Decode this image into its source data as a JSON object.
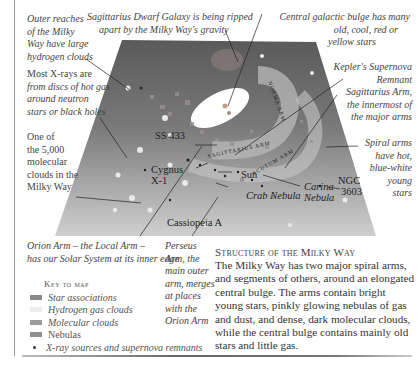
{
  "map": {
    "callouts_left": [
      {
        "id": "outer-reaches",
        "lines": [
          "Outer reaches",
          "of the Milky",
          "Way have large",
          "hydrogen clouds"
        ]
      },
      {
        "id": "x-rays",
        "lines": [
          "Most X-rays are",
          "from discs of hot gas",
          "around neutron",
          "stars or black holes"
        ]
      },
      {
        "id": "molecular-clouds",
        "lines": [
          "One of",
          "the 5,000",
          "molecular",
          "clouds in the",
          "Milky Way"
        ]
      }
    ],
    "callouts_top": [
      {
        "id": "sagittarius-dwarf",
        "lines": [
          "Sagittarius Dwarf Galaxy is being ripped",
          "apart by the Milky Way's gravity"
        ]
      },
      {
        "id": "central-bulge",
        "lines": [
          "Central galactic bulge has many",
          "old, cool, red or",
          "yellow stars"
        ]
      }
    ],
    "callouts_right": [
      {
        "id": "kepler",
        "lines": [
          "Kepler's Supernova",
          "Remnant"
        ]
      },
      {
        "id": "sagittarius-arm",
        "lines": [
          "Sagittarius Arm,",
          "the innermost of",
          "the major arms"
        ]
      },
      {
        "id": "spiral-arms",
        "lines": [
          "Spiral arms",
          "have hot,",
          "blue-white",
          "young",
          "stars"
        ]
      }
    ],
    "callouts_bottom": [
      {
        "id": "orion-arm",
        "lines": [
          "Orion Arm – the Local Arm –",
          "has our Solar System at its inner edge"
        ]
      },
      {
        "id": "perseus-arm",
        "lines": [
          "Perseus",
          "Arm, the",
          "main outer",
          "arm, merges",
          "at places",
          "with the",
          "Orion Arm"
        ]
      }
    ],
    "map_labels": {
      "ss433": "SS 433",
      "cygnus": "Cygnus",
      "cygnus2": "X-1",
      "sun": "Sun",
      "crab": "Crab Nebula",
      "carina": "Carina",
      "carina2": "Nebula",
      "ngc": "NGC",
      "ngc2": "3603",
      "cassiopeia": "Cassiopeia A",
      "arm_label_1": "SAGITTARIUS ARM",
      "arm_label_2": "NORMA ARM",
      "arm_label_3": "SCUTUM ARM"
    }
  },
  "key": {
    "title": "Key to map",
    "items": [
      {
        "label": "Star associations",
        "color": "#8a8a8a"
      },
      {
        "label": "Hydrogen gas clouds",
        "color": "#e6e6e6"
      },
      {
        "label": "Molecular clouds",
        "color": "#9b9b9b"
      },
      {
        "label": "Nebulas",
        "color": "#8f8f8f"
      },
      {
        "label": "X-ray sources and supernova remnants",
        "color": "#333333",
        "marker": "dot"
      }
    ]
  },
  "story": {
    "title": "Structure of the Milky Way",
    "body": "The Milky Way has two major spiral arms, and segments of others, around an elongated central bulge. The arms contain bright young stars, pinkly glowing nebulas of gas and dust, and dense, dark molecular clouds, while the central bulge contains mainly old stars and little gas."
  }
}
